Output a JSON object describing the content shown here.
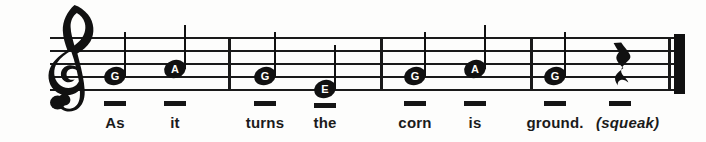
{
  "sheet": {
    "title": "Single-line vocal staff with lyrics",
    "clef": "treble-clef",
    "ink_color": "#111111",
    "paper_color": "#fdfdfc",
    "staff": {
      "line_count": 5,
      "left": 50,
      "right": 685,
      "line_y": [
        37,
        50,
        63,
        76,
        89
      ]
    },
    "barlines": [
      228,
      380,
      530
    ],
    "final_barline": {
      "thin_x": 668,
      "thick_x": 674
    }
  },
  "notes": [
    {
      "letter": "G",
      "x": 115,
      "y": 76,
      "stem_top": 32,
      "measure": 1
    },
    {
      "letter": "A",
      "x": 175,
      "y": 69,
      "stem_top": 25,
      "measure": 1
    },
    {
      "letter": "G",
      "x": 265,
      "y": 76,
      "stem_top": 32,
      "measure": 2
    },
    {
      "letter": "E",
      "x": 325,
      "y": 89,
      "stem_top": 45,
      "measure": 2
    },
    {
      "letter": "G",
      "x": 415,
      "y": 76,
      "stem_top": 32,
      "measure": 3
    },
    {
      "letter": "A",
      "x": 475,
      "y": 69,
      "stem_top": 25,
      "measure": 3
    },
    {
      "letter": "G",
      "x": 555,
      "y": 76,
      "stem_top": 32,
      "measure": 4
    }
  ],
  "rests": [
    {
      "type": "quarter-rest",
      "x": 620,
      "measure": 4
    }
  ],
  "rhythm_dashes": [
    {
      "x": 115,
      "y": 101
    },
    {
      "x": 175,
      "y": 101
    },
    {
      "x": 265,
      "y": 101
    },
    {
      "x": 325,
      "y": 103
    },
    {
      "x": 415,
      "y": 101
    },
    {
      "x": 475,
      "y": 101
    },
    {
      "x": 555,
      "y": 101
    },
    {
      "x": 620,
      "y": 101
    }
  ],
  "lyrics": [
    {
      "text": "As",
      "x": 115,
      "italic": false
    },
    {
      "text": "it",
      "x": 175,
      "italic": false
    },
    {
      "text": "turns",
      "x": 265,
      "italic": false
    },
    {
      "text": "the",
      "x": 325,
      "italic": false
    },
    {
      "text": "corn",
      "x": 415,
      "italic": false
    },
    {
      "text": "is",
      "x": 475,
      "italic": false
    },
    {
      "text": "ground.",
      "x": 555,
      "italic": false
    },
    {
      "text": "(squeak)",
      "x": 596,
      "italic": true
    }
  ],
  "lyric_sentence": "As it turns the corn is ground. (squeak)"
}
